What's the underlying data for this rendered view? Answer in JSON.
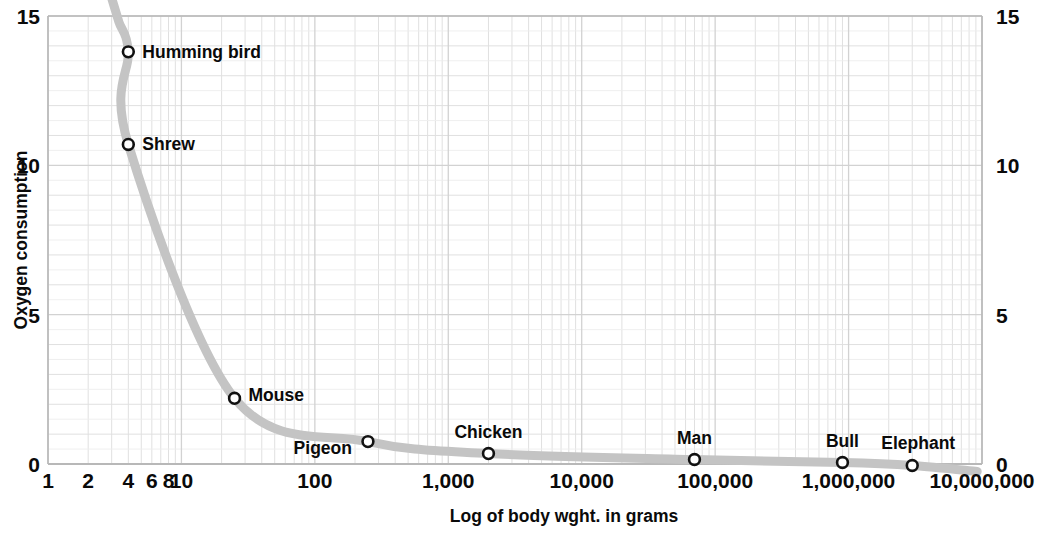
{
  "chart_data": {
    "type": "line",
    "title": "",
    "subtitle": "",
    "xlabel": "Log of body wght. in grams",
    "ylabel": "Oxygen consumption",
    "xscale": "log",
    "yscale": "linear",
    "xlim": [
      1,
      10000000
    ],
    "ylim": [
      0,
      15
    ],
    "grid": true,
    "legend": null,
    "x_tick_labels": [
      "1",
      "2",
      "4",
      "6",
      "8",
      "10",
      "100",
      "1,000",
      "10,000",
      "100,000",
      "1,000,000",
      "10,000,000"
    ],
    "x_tick_values": [
      1,
      2,
      4,
      6,
      8,
      10,
      100,
      1000,
      10000,
      100000,
      1000000,
      10000000
    ],
    "y_tick_labels_left": [
      "0",
      "5",
      "10",
      "15"
    ],
    "y_tick_labels_right": [
      "0",
      "5",
      "10",
      "15"
    ],
    "y_tick_values": [
      0,
      5,
      10,
      15
    ],
    "series": [
      {
        "name": "Oxygen consumption vs body weight",
        "points": [
          {
            "label": "Humming bird",
            "x": 4,
            "y": 13.8
          },
          {
            "label": "Shrew",
            "x": 4,
            "y": 10.7
          },
          {
            "label": "Mouse",
            "x": 25,
            "y": 2.2
          },
          {
            "label": "Pigeon",
            "x": 250,
            "y": 0.75
          },
          {
            "label": "Chicken",
            "x": 2000,
            "y": 0.35
          },
          {
            "label": "Man",
            "x": 70000,
            "y": 0.15
          },
          {
            "label": "Bull",
            "x": 900000,
            "y": 0.05
          },
          {
            "label": "Elephant",
            "x": 3000000,
            "y": -0.05
          }
        ]
      }
    ],
    "colors": {
      "curve": "#c4c4c4",
      "grid_major": "#d2d2d2",
      "grid_minor": "#e0e0e0",
      "axis": "#b8b8b8",
      "marker_stroke": "#111111",
      "marker_fill": "#ffffff",
      "text": "#0a0a0a",
      "background": "#ffffff"
    },
    "annotations": [
      {
        "text": "Humming bird",
        "anchor": "right-of-point"
      },
      {
        "text": "Shrew",
        "anchor": "right-of-point"
      },
      {
        "text": "Mouse",
        "anchor": "right-of-point"
      },
      {
        "text": "Pigeon",
        "anchor": "left-below-point"
      },
      {
        "text": "Chicken",
        "anchor": "above-point"
      },
      {
        "text": "Man",
        "anchor": "above-point"
      },
      {
        "text": "Bull",
        "anchor": "above-point"
      },
      {
        "text": "Elephant",
        "anchor": "above-point"
      }
    ]
  },
  "axes": {
    "y_title": "Oxygen consumption",
    "x_title": "Log of body wght. in grams",
    "y_left": {
      "t0": "0",
      "t5": "5",
      "t10": "10",
      "t15": "15"
    },
    "y_right": {
      "t0": "0",
      "t5": "5",
      "t10": "10",
      "t15": "15"
    },
    "x_ticks": {
      "t1": "1",
      "t2": "2",
      "t4": "4",
      "t6": "6",
      "t8": "8",
      "t10": "10",
      "t100": "100",
      "t1000": "1,000",
      "t10000": "10,000",
      "t100000": "100,000",
      "t1000000": "1,000,000",
      "t10000000": "10,000,000"
    }
  },
  "point_labels": {
    "humming_bird": "Humming bird",
    "shrew": "Shrew",
    "mouse": "Mouse",
    "pigeon": "Pigeon",
    "chicken": "Chicken",
    "man": "Man",
    "bull": "Bull",
    "elephant": "Elephant"
  }
}
